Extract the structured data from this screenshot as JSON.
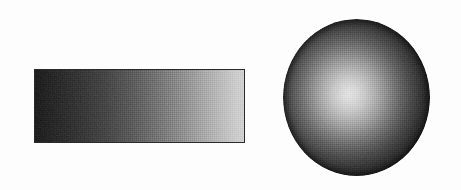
{
  "figure": {
    "background_color": "#fdfdfd",
    "width": 461,
    "height": 190,
    "caption": "",
    "shapes": [
      {
        "name": "gradient-bar",
        "type": "rectangle",
        "label": "",
        "x": 34,
        "y": 69,
        "width": 211,
        "height": 74,
        "gradient_type": "linear",
        "gradient_direction": "left-to-right",
        "start_color": "#101010",
        "end_color": "#d2d2d2",
        "border_color": "#2a2a2a",
        "texture": "halftone-dither"
      },
      {
        "name": "gradient-sphere",
        "type": "circle",
        "label": "",
        "x": 283,
        "y": 19,
        "width": 147,
        "height": 157,
        "gradient_type": "radial",
        "highlight_position": "45% 48%",
        "center_color": "#e6e6e6",
        "edge_color": "#0d0d0d",
        "texture": "halftone-dither"
      }
    ]
  }
}
